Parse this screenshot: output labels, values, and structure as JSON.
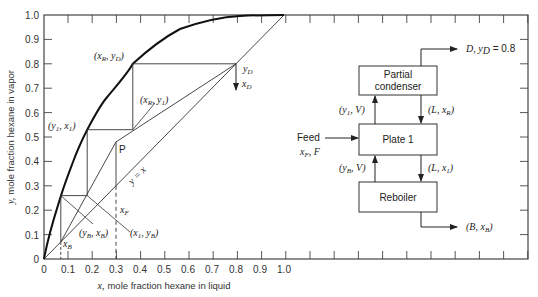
{
  "chart_data": {
    "type": "line",
    "title": "",
    "xlabel_prefix": "x,",
    "xlabel": "mole fraction hexane in liquid",
    "ylabel_prefix": "y,",
    "ylabel": "mole fraction hexane in vapor",
    "xlim": [
      0,
      1.0
    ],
    "ylim": [
      0,
      1.0
    ],
    "x_ticks": [
      "0",
      "0.1",
      "0.2",
      "0.3",
      "0.4",
      "0.5",
      "0.6",
      "0.7",
      "0.8",
      "0.9",
      "1.0"
    ],
    "y_ticks": [
      "0",
      "0.1",
      "0.2",
      "0.3",
      "0.4",
      "0.5",
      "0.6",
      "0.7",
      "0.8",
      "0.9",
      "1.0"
    ],
    "grid": false,
    "series": [
      {
        "name": "equilibrium curve",
        "x": [
          0,
          0.03,
          0.07,
          0.12,
          0.18,
          0.26,
          0.37,
          0.5,
          0.62,
          0.75,
          1.0
        ],
        "y": [
          0,
          0.12,
          0.26,
          0.4,
          0.53,
          0.66,
          0.8,
          0.91,
          0.97,
          0.995,
          1.0
        ]
      },
      {
        "name": "y = x",
        "x": [
          0,
          1.0
        ],
        "y": [
          0,
          1.0
        ]
      },
      {
        "name": "rectifying operating line",
        "x": [
          0.8,
          0.37,
          0.3
        ],
        "y": [
          0.8,
          0.53,
          0.48
        ]
      },
      {
        "name": "stripping operating line",
        "x": [
          0.07,
          0.18,
          0.3
        ],
        "y": [
          0.07,
          0.26,
          0.48
        ]
      },
      {
        "name": "stage steps",
        "x": [
          0.8,
          0.37,
          0.37,
          0.18,
          0.18,
          0.07,
          0.07
        ],
        "y": [
          0.8,
          0.8,
          0.53,
          0.53,
          0.26,
          0.26,
          0.07
        ]
      },
      {
        "name": "feed line x_F",
        "x": [
          0.3,
          0.3
        ],
        "y": [
          0,
          0.48
        ]
      }
    ],
    "annotations": [
      {
        "text": "(x_R, y_D)",
        "x": 0.37,
        "y": 0.8
      },
      {
        "text": "(x_R, y_1)",
        "x": 0.37,
        "y": 0.53
      },
      {
        "text": "(y_1, x_1)",
        "x": 0.18,
        "y": 0.53
      },
      {
        "text": "P",
        "x": 0.3,
        "y": 0.48
      },
      {
        "text": "y = x",
        "x": 0.5,
        "y": 0.47
      },
      {
        "text": "y_D",
        "x": 0.8,
        "y": 0.8
      },
      {
        "text": "x_D",
        "x": 0.8,
        "y": 0.72
      },
      {
        "text": "x_F",
        "x": 0.3,
        "y": 0.2
      },
      {
        "text": "x_B",
        "x": 0.07,
        "y": 0.07
      },
      {
        "text": "(y_B, x_B)",
        "x": 0.18,
        "y": 0.1
      },
      {
        "text": "(x_1, y_B)",
        "x": 0.37,
        "y": 0.1
      }
    ]
  },
  "labels": {
    "y_ticks": [
      "0",
      "0.1",
      "0.2",
      "0.3",
      "0.4",
      "0.5",
      "0.6",
      "0.7",
      "0.8",
      "0.9",
      "1.0"
    ],
    "x_ticks": [
      "0",
      "0.1",
      "0.2",
      "0.3",
      "0.4",
      "0.5",
      "0.6",
      "0.7",
      "0.8",
      "0.9",
      "1.0"
    ],
    "xlabel_var": "x,",
    "xlabel_text": "mole fraction hexane in liquid",
    "ylabel_var": "y,",
    "ylabel_text": "mole fraction hexane in vapor",
    "xR_yD": "(x",
    "sub_R": "R",
    "sub_D": "D",
    "sub_1": "1",
    "sub_B": "B",
    "sub_F": "F",
    "P": "P",
    "y_eq_x": "y = x",
    "y_var": "y",
    "x_var": "x",
    "comma": ",",
    "close": ")",
    "open": "("
  },
  "diagram": {
    "condenser_line1": "Partial",
    "condenser_line2": "condenser",
    "plate": "Plate 1",
    "reboiler": "Reboiler",
    "feed_label": "Feed",
    "feed_vars": "x",
    "feed_F": ", F",
    "distillate": "D, y",
    "distillate_value": " = 0.8",
    "vapor_top": "(y",
    "vapor_top_V": ", V)",
    "liquid_top": "(L, x",
    "vapor_bottom": "(y",
    "vapor_bottom_V": ", V)",
    "liquid_bottom": "(L, x",
    "bottoms": "(B, x"
  }
}
